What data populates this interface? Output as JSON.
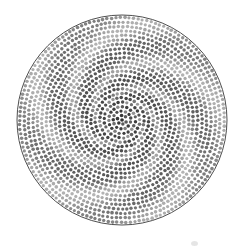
{
  "figure": {
    "background_color": "#ffffff"
  },
  "canvas": {
    "width": 239,
    "height": 247
  },
  "chart_data": {
    "type": "scatter",
    "xlabel": "",
    "ylabel": "",
    "grid": false,
    "legend": false,
    "xlim": [
      0,
      239
    ],
    "ylim": [
      0,
      247
    ],
    "disk": {
      "center_x": 122,
      "center_y": 120,
      "radius": 105,
      "outline_color": "#3a3a3a",
      "outline_width": 0.9,
      "fill_color": "#ffffff"
    },
    "dot_lattice": {
      "arrangement": "rings",
      "spacing": 4.45,
      "dot_radius": 1.7,
      "dot_shape": "circle",
      "ring_count": 24,
      "approx_dot_count": 1750,
      "angular_jitter": 0.16,
      "radial_jitter": 0.16
    },
    "shading": {
      "model": "spiral-bands",
      "arms": 5,
      "spiral_tightness": 2.35,
      "spin_direction": "counter-clockwise",
      "band_contrast": 0.46,
      "radial_falloff": "dark-center-to-light-edge",
      "value_min_gray": "#2b2b2b",
      "value_max_gray": "#ededed",
      "center_gray": "#303030",
      "edge_gray": "#9a9a9a",
      "light_band_gray": "#e8e8e8",
      "dark_band_gray": "#7c7c7c"
    }
  },
  "artifact": {
    "name": "faint-smudge",
    "x": 191,
    "y": 241,
    "color": "#000000",
    "opacity": 0.1
  }
}
